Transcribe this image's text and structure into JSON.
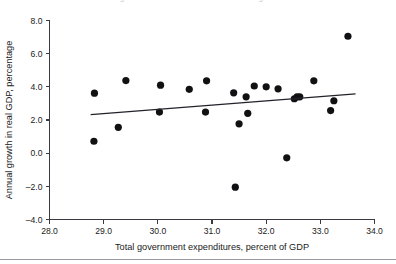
{
  "figure": {
    "cut_title": "Figure: Government size and economic growth",
    "background_color": "#ffffff",
    "point_color": "#111114",
    "line_color": "#22222a",
    "axis_color": "#3a3a42"
  },
  "chart_data": {
    "type": "scatter",
    "title": "",
    "xlabel": "Total government expenditures, percent of GDP",
    "ylabel": "Annual growth in real GDP, percentage",
    "xlim": [
      28.0,
      34.0
    ],
    "ylim": [
      -4.0,
      8.0
    ],
    "xticks": [
      "28.0",
      "29.0",
      "30.0",
      "31.0",
      "32.0",
      "33.0",
      "34.0"
    ],
    "yticks": [
      "8.0",
      "6.0",
      "4.0",
      "2.0",
      "0.0",
      "-2.0",
      "-4.0"
    ],
    "xtick_values": [
      28.0,
      29.0,
      30.0,
      31.0,
      32.0,
      33.0,
      34.0
    ],
    "ytick_values": [
      8.0,
      6.0,
      4.0,
      2.0,
      0.0,
      -2.0,
      -4.0
    ],
    "grid": false,
    "legend": null,
    "points": [
      {
        "x": 28.83,
        "y": 3.62
      },
      {
        "x": 28.82,
        "y": 0.72
      },
      {
        "x": 29.27,
        "y": 1.56
      },
      {
        "x": 29.41,
        "y": 4.38
      },
      {
        "x": 30.05,
        "y": 4.1
      },
      {
        "x": 30.03,
        "y": 2.48
      },
      {
        "x": 30.58,
        "y": 3.85
      },
      {
        "x": 30.9,
        "y": 4.36
      },
      {
        "x": 30.88,
        "y": 2.48
      },
      {
        "x": 31.4,
        "y": 3.64
      },
      {
        "x": 31.43,
        "y": -2.05
      },
      {
        "x": 31.5,
        "y": 1.77
      },
      {
        "x": 31.63,
        "y": 3.4
      },
      {
        "x": 31.66,
        "y": 2.4
      },
      {
        "x": 31.78,
        "y": 4.05
      },
      {
        "x": 32.0,
        "y": 4.0
      },
      {
        "x": 32.22,
        "y": 3.88
      },
      {
        "x": 32.38,
        "y": -0.28
      },
      {
        "x": 32.52,
        "y": 3.28
      },
      {
        "x": 32.57,
        "y": 3.4
      },
      {
        "x": 32.62,
        "y": 3.4
      },
      {
        "x": 32.88,
        "y": 4.36
      },
      {
        "x": 33.19,
        "y": 2.57
      },
      {
        "x": 33.25,
        "y": 3.16
      },
      {
        "x": 33.51,
        "y": 7.05
      }
    ],
    "trend_line": {
      "x_start": 28.76,
      "y_start": 2.32,
      "x_end": 33.65,
      "y_end": 3.58
    }
  }
}
